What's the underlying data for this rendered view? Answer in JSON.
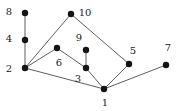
{
  "figure": {
    "kind": "undirected-graph-drawing",
    "background_color": "#ffffff",
    "node_color": "#141414",
    "edge_color": "#4d4d4d",
    "label_color": "#1a1a1a",
    "node_radius": 3.2,
    "edge_width": 0.9,
    "width": 180,
    "height": 111
  },
  "graph_data": {
    "type": "graph",
    "node_count": 10,
    "edge_count": 11,
    "nodes": [
      {
        "id": "8",
        "label": "8",
        "x": 25,
        "y": 13,
        "label_x": 9,
        "label_y": 12
      },
      {
        "id": "10",
        "label": "10",
        "x": 71,
        "y": 14,
        "label_x": 85,
        "label_y": 13
      },
      {
        "id": "4",
        "label": "4",
        "x": 25,
        "y": 40,
        "label_x": 9,
        "label_y": 39
      },
      {
        "id": "9",
        "label": "9",
        "x": 86,
        "y": 50,
        "label_x": 79,
        "label_y": 38
      },
      {
        "id": "6",
        "label": "6",
        "x": 57,
        "y": 48,
        "label_x": 59,
        "label_y": 63
      },
      {
        "id": "5",
        "label": "5",
        "x": 129,
        "y": 64,
        "label_x": 133,
        "label_y": 51
      },
      {
        "id": "7",
        "label": "7",
        "x": 166,
        "y": 65,
        "label_x": 168,
        "label_y": 48
      },
      {
        "id": "2",
        "label": "2",
        "x": 25,
        "y": 68,
        "label_x": 9,
        "label_y": 69
      },
      {
        "id": "3",
        "label": "3",
        "x": 86,
        "y": 68,
        "label_x": 78,
        "label_y": 79
      },
      {
        "id": "1",
        "label": "1",
        "x": 104,
        "y": 89,
        "label_x": 105,
        "label_y": 103
      }
    ],
    "edges": [
      {
        "source": "8",
        "target": "4"
      },
      {
        "source": "4",
        "target": "2"
      },
      {
        "source": "2",
        "target": "10"
      },
      {
        "source": "2",
        "target": "6"
      },
      {
        "source": "2",
        "target": "1"
      },
      {
        "source": "6",
        "target": "3"
      },
      {
        "source": "9",
        "target": "3"
      },
      {
        "source": "3",
        "target": "1"
      },
      {
        "source": "10",
        "target": "5"
      },
      {
        "source": "5",
        "target": "1"
      },
      {
        "source": "1",
        "target": "7"
      }
    ]
  }
}
